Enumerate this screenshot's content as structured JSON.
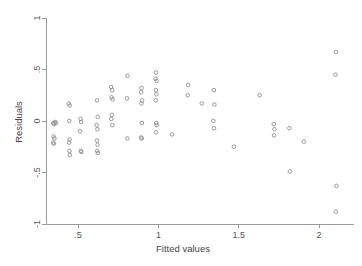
{
  "chart_data": {
    "type": "scatter",
    "title": "",
    "xlabel": "Fitted values",
    "ylabel": "Residuals",
    "xlim": [
      0.3,
      2.18
    ],
    "ylim": [
      -1.0,
      1.0
    ],
    "grid": false,
    "legend": null,
    "xticks": [
      0.5,
      1.0,
      1.5,
      2.0
    ],
    "xticklabels": [
      ".5",
      "1",
      "1.5",
      "2"
    ],
    "yticks": [
      1.0,
      0.5,
      0.0,
      -0.5,
      -1.0
    ],
    "yticklabels": [
      "1",
      ".5",
      "0",
      "-.5",
      "-1"
    ],
    "marker": "open-circle",
    "marker_color": "#8f8f93",
    "series": [
      {
        "name": "residuals",
        "points": [
          [
            0.345,
            -0.02
          ],
          [
            0.35,
            -0.03
          ],
          [
            0.357,
            -0.01
          ],
          [
            0.363,
            -0.02
          ],
          [
            0.347,
            -0.15
          ],
          [
            0.352,
            -0.17
          ],
          [
            0.349,
            -0.22
          ],
          [
            0.345,
            -0.21
          ],
          [
            0.442,
            0.17
          ],
          [
            0.448,
            0.15
          ],
          [
            0.445,
            0.0
          ],
          [
            0.447,
            -0.18
          ],
          [
            0.444,
            -0.21
          ],
          [
            0.446,
            -0.29
          ],
          [
            0.448,
            -0.33
          ],
          [
            0.515,
            0.02
          ],
          [
            0.519,
            -0.01
          ],
          [
            0.512,
            -0.1
          ],
          [
            0.517,
            -0.29
          ],
          [
            0.52,
            -0.3
          ],
          [
            0.618,
            0.2
          ],
          [
            0.622,
            0.04
          ],
          [
            0.615,
            -0.04
          ],
          [
            0.62,
            -0.08
          ],
          [
            0.617,
            -0.19
          ],
          [
            0.621,
            -0.23
          ],
          [
            0.619,
            -0.29
          ],
          [
            0.623,
            -0.31
          ],
          [
            0.705,
            0.33
          ],
          [
            0.712,
            0.3
          ],
          [
            0.708,
            0.23
          ],
          [
            0.715,
            0.21
          ],
          [
            0.71,
            0.06
          ],
          [
            0.706,
            0.02
          ],
          [
            0.713,
            -0.04
          ],
          [
            0.808,
            0.44
          ],
          [
            0.804,
            0.22
          ],
          [
            0.807,
            -0.17
          ],
          [
            0.895,
            0.32
          ],
          [
            0.892,
            0.28
          ],
          [
            0.898,
            0.2
          ],
          [
            0.894,
            0.17
          ],
          [
            0.897,
            -0.02
          ],
          [
            0.893,
            -0.16
          ],
          [
            0.896,
            -0.17
          ],
          [
            0.985,
            0.47
          ],
          [
            0.982,
            0.41
          ],
          [
            0.988,
            0.39
          ],
          [
            0.984,
            0.3
          ],
          [
            0.987,
            0.26
          ],
          [
            0.983,
            0.2
          ],
          [
            0.986,
            -0.02
          ],
          [
            0.989,
            -0.04
          ],
          [
            0.984,
            -0.11
          ],
          [
            1.085,
            -0.13
          ],
          [
            1.185,
            0.35
          ],
          [
            1.182,
            0.25
          ],
          [
            1.27,
            0.17
          ],
          [
            1.345,
            0.3
          ],
          [
            1.348,
            0.16
          ],
          [
            1.342,
            0.0
          ],
          [
            1.346,
            -0.07
          ],
          [
            1.47,
            -0.25
          ],
          [
            1.63,
            0.25
          ],
          [
            1.718,
            -0.03
          ],
          [
            1.722,
            -0.08
          ],
          [
            1.72,
            -0.14
          ],
          [
            1.815,
            -0.07
          ],
          [
            1.818,
            -0.49
          ],
          [
            1.905,
            -0.2
          ],
          [
            2.105,
            0.67
          ],
          [
            2.102,
            0.45
          ],
          [
            2.108,
            -0.63
          ],
          [
            2.104,
            -0.88
          ]
        ]
      }
    ]
  },
  "axes": {
    "x_axis_name": "fitted-values-axis",
    "y_axis_name": "residuals-axis"
  }
}
